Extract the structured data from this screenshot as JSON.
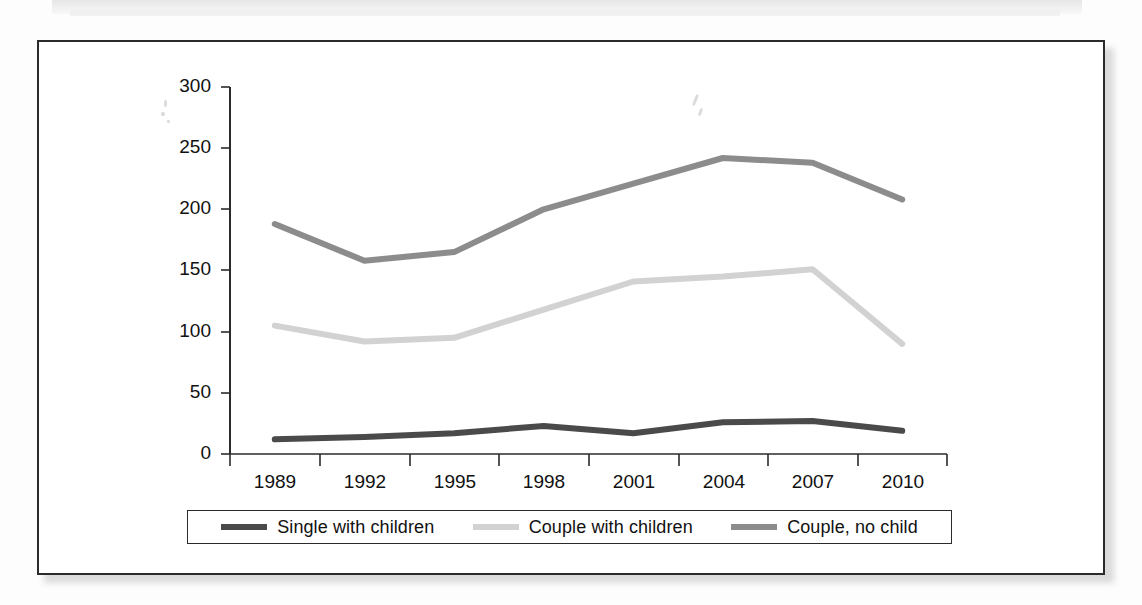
{
  "figure": {
    "kind": "line-chart-scan",
    "frame_border_color": "#2b2b2b",
    "background_color": "#ffffff"
  },
  "chart_data": {
    "type": "line",
    "title": "",
    "subtitle": "",
    "xlabel": "",
    "ylabel": "",
    "categories": [
      "1989",
      "1992",
      "1995",
      "1998",
      "2001",
      "2004",
      "2007",
      "2010"
    ],
    "yticks": [
      0,
      50,
      100,
      150,
      200,
      250,
      300
    ],
    "ylim": [
      0,
      300
    ],
    "grid": false,
    "legend_position": "bottom",
    "series": [
      {
        "name": "Single with children",
        "color": "#4a4a4a",
        "values": [
          12,
          14,
          17,
          23,
          17,
          26,
          27,
          19
        ]
      },
      {
        "name": "Couple with children",
        "color": "#d2d2d2",
        "values": [
          105,
          92,
          95,
          118,
          141,
          145,
          151,
          90
        ]
      },
      {
        "name": "Couple, no child",
        "color": "#8c8c8c",
        "values": [
          188,
          158,
          165,
          200,
          221,
          242,
          238,
          208
        ]
      }
    ]
  },
  "legend": {
    "entries": [
      {
        "label": "Single with children",
        "color": "#4a4a4a"
      },
      {
        "label": "Couple with children",
        "color": "#d2d2d2"
      },
      {
        "label": "Couple, no child",
        "color": "#8c8c8c"
      }
    ]
  }
}
